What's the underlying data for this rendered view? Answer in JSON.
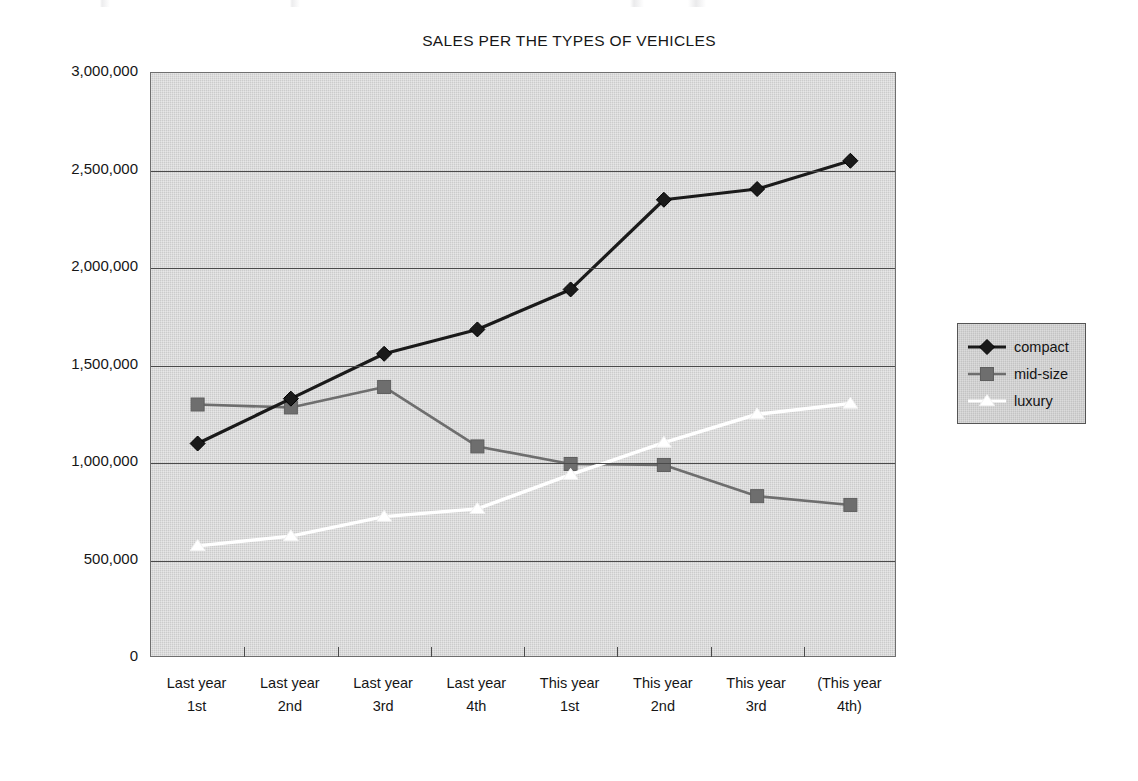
{
  "chart_data": {
    "type": "line",
    "title": "SALES PER THE TYPES OF VEHICLES",
    "xlabel": "",
    "ylabel": "",
    "categories": [
      "Last year 1st",
      "Last year 2nd",
      "Last year 3rd",
      "Last year 4th",
      "This year 1st",
      "This year 2nd",
      "This year 3rd",
      "(This year 4th)"
    ],
    "category_lines": [
      [
        "Last year",
        "1st"
      ],
      [
        "Last year",
        "2nd"
      ],
      [
        "Last year",
        "3rd"
      ],
      [
        "Last year",
        "4th"
      ],
      [
        "This year",
        "1st"
      ],
      [
        "This year",
        "2nd"
      ],
      [
        "This year",
        "3rd"
      ],
      [
        "(This year",
        "4th)"
      ]
    ],
    "series": [
      {
        "name": "compact",
        "marker": "diamond",
        "color": "#1a1a1a",
        "values": [
          1100000,
          1330000,
          1560000,
          1685000,
          1890000,
          2350000,
          2405000,
          2550000
        ]
      },
      {
        "name": "mid-size",
        "marker": "square",
        "color": "#6e6e6e",
        "values": [
          1300000,
          1285000,
          1390000,
          1085000,
          995000,
          990000,
          830000,
          785000
        ]
      },
      {
        "name": "luxury",
        "marker": "triangle",
        "color": "#ffffff",
        "values": [
          575000,
          625000,
          725000,
          765000,
          940000,
          1105000,
          1250000,
          1305000
        ]
      }
    ],
    "ylim": [
      0,
      3000000
    ],
    "ytick_values": [
      0,
      500000,
      1000000,
      1500000,
      2000000,
      2500000,
      3000000
    ],
    "ytick_labels": [
      "0",
      "500,000",
      "1,000,000",
      "1,500,000",
      "2,000,000",
      "2,500,000",
      "3,000,000"
    ],
    "grid": true,
    "grid_axis": "y",
    "legend_position": "right",
    "legend_entries": [
      "compact",
      "mid-size",
      "luxury"
    ],
    "plot_background_color": "#d2d2d2",
    "figure_background_color": "#ffffff"
  }
}
